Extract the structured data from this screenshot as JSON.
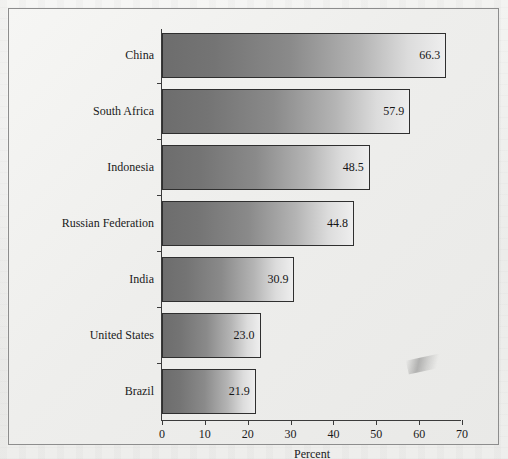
{
  "chart_data": {
    "type": "bar",
    "orientation": "horizontal",
    "title": "",
    "categories": [
      "China",
      "South Africa",
      "Indonesia",
      "Russian Federation",
      "India",
      "United States",
      "Brazil"
    ],
    "values": [
      66.3,
      57.9,
      48.5,
      44.8,
      30.9,
      23.0,
      21.9
    ],
    "value_labels": [
      "66.3",
      "57.9",
      "48.5",
      "44.8",
      "30.9",
      "23.0",
      "21.9"
    ],
    "xlabel": "Percent",
    "ylabel": "",
    "xlim": [
      0,
      70
    ],
    "xticks": [
      0,
      10,
      20,
      30,
      40,
      50,
      60,
      70
    ],
    "xtick_labels": [
      "0",
      "10",
      "20",
      "30",
      "40",
      "50",
      "60",
      "70"
    ],
    "grid": false,
    "legend": false,
    "bar_gradient_from": "#6d6d6d",
    "bar_gradient_to": "#eeeeee",
    "bar_border_color": "#2f2f2f",
    "axis_color": "#3b3b3b",
    "text_color": "#1a1a1a",
    "background_color": "#efefed"
  }
}
